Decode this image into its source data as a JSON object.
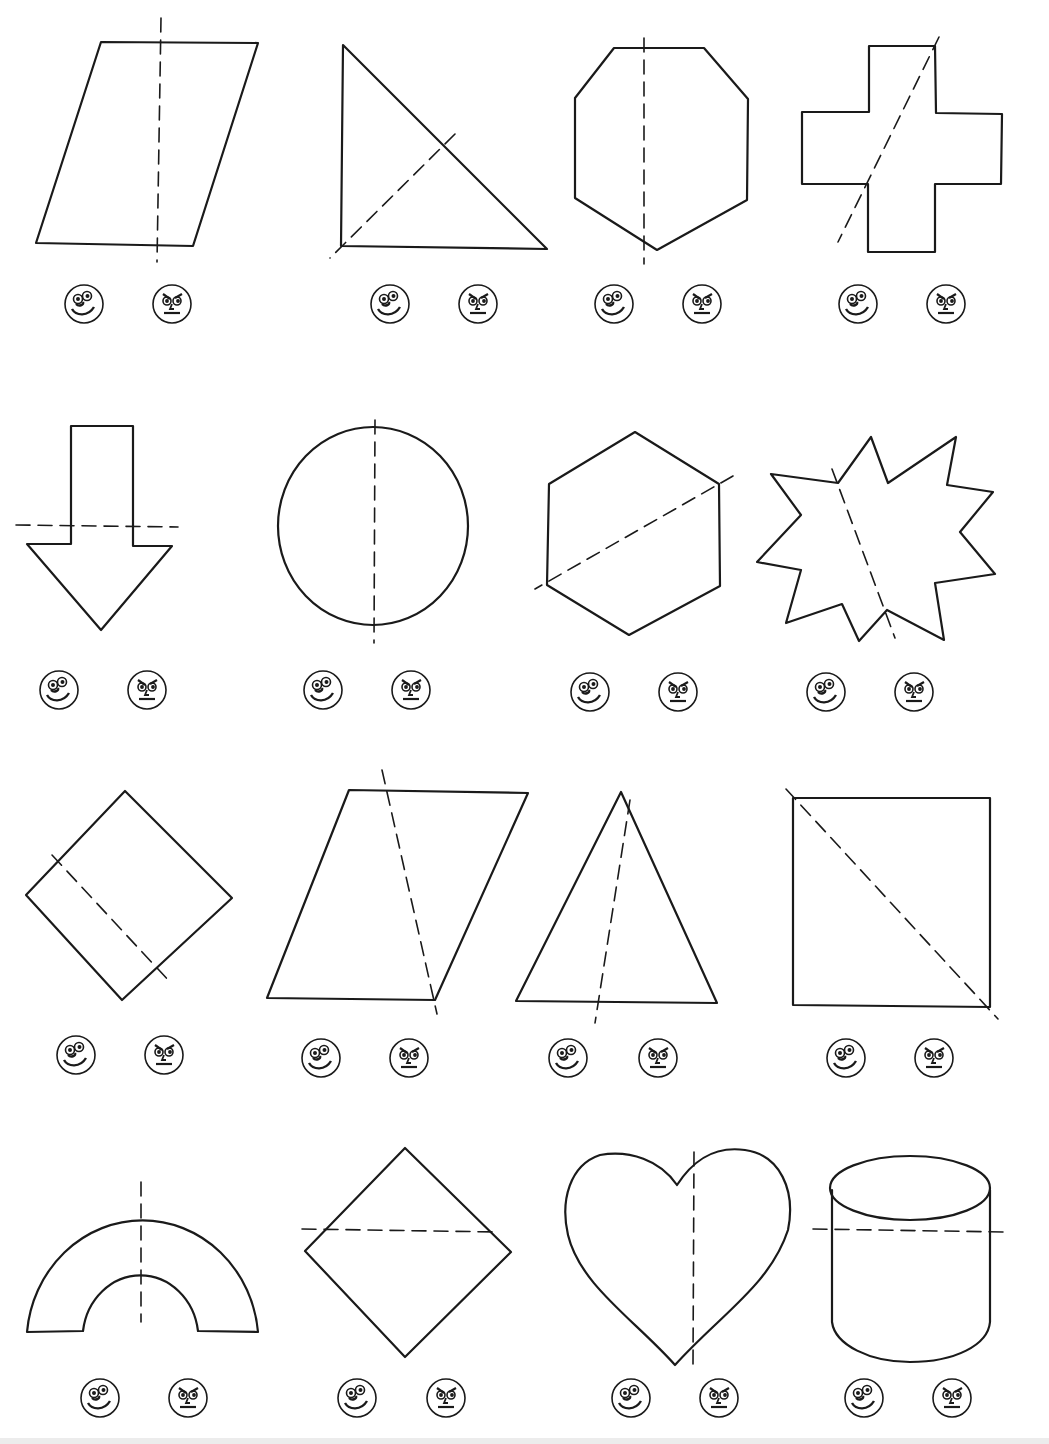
{
  "worksheet": {
    "topic": "Lines of symmetry",
    "answer_options": [
      {
        "id": "yes",
        "icon": "smiley-face-icon",
        "meaning": "symmetric"
      },
      {
        "id": "no",
        "icon": "frowning-face-icon",
        "meaning": "not symmetric"
      }
    ],
    "colors": {
      "ink": "#1a1a1a",
      "paper": "#ffffff"
    },
    "items": [
      {
        "row": 1,
        "col": 1,
        "shape": "parallelogram",
        "fold_line": "vertical"
      },
      {
        "row": 1,
        "col": 2,
        "shape": "right triangle",
        "fold_line": "diagonal"
      },
      {
        "row": 1,
        "col": 3,
        "shape": "hexagon",
        "fold_line": "vertical"
      },
      {
        "row": 1,
        "col": 4,
        "shape": "cross",
        "fold_line": "diagonal"
      },
      {
        "row": 2,
        "col": 1,
        "shape": "down arrow",
        "fold_line": "horizontal"
      },
      {
        "row": 2,
        "col": 2,
        "shape": "circle",
        "fold_line": "vertical"
      },
      {
        "row": 2,
        "col": 3,
        "shape": "hexagon",
        "fold_line": "diagonal"
      },
      {
        "row": 2,
        "col": 4,
        "shape": "star burst",
        "fold_line": "diagonal"
      },
      {
        "row": 3,
        "col": 1,
        "shape": "tilted square",
        "fold_line": "diagonal"
      },
      {
        "row": 3,
        "col": 2,
        "shape": "parallelogram",
        "fold_line": "diagonal"
      },
      {
        "row": 3,
        "col": 3,
        "shape": "isosceles triangle",
        "fold_line": "near-vertical"
      },
      {
        "row": 3,
        "col": 4,
        "shape": "square",
        "fold_line": "diagonal"
      },
      {
        "row": 4,
        "col": 1,
        "shape": "arch",
        "fold_line": "vertical"
      },
      {
        "row": 4,
        "col": 2,
        "shape": "diamond",
        "fold_line": "horizontal"
      },
      {
        "row": 4,
        "col": 3,
        "shape": "heart",
        "fold_line": "vertical"
      },
      {
        "row": 4,
        "col": 4,
        "shape": "cylinder",
        "fold_line": "horizontal"
      }
    ]
  }
}
